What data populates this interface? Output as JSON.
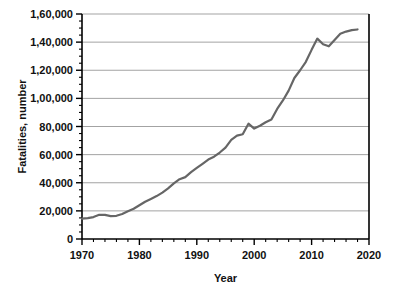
{
  "chart_data": {
    "type": "line",
    "title": "",
    "xlabel": "Year",
    "ylabel": "Fatalities, number",
    "xlim": [
      1970,
      2020
    ],
    "ylim": [
      0,
      160000
    ],
    "grid": "horizontal",
    "legend": "none",
    "line_color": "#666666",
    "axis_color": "#000000",
    "grid_color": "#999999",
    "x_ticks_major": [
      1970,
      1980,
      1990,
      2000,
      2010,
      2020
    ],
    "x_tick_labels": [
      "1970",
      "1980",
      "1990",
      "2000",
      "2010",
      "2020"
    ],
    "x_tick_minor_step": 2,
    "y_ticks_major": [
      0,
      20000,
      40000,
      60000,
      80000,
      100000,
      120000,
      140000,
      160000
    ],
    "y_tick_labels": [
      "0",
      "20,000",
      "40,000",
      "60,000",
      "80,000",
      "1,00,000",
      "1,20,000",
      "1,40,000",
      "1,60,000"
    ],
    "y_tick_minor_step": 5000,
    "series": [
      {
        "name": "Fatalities",
        "x": [
          1970,
          1971,
          1972,
          1973,
          1974,
          1975,
          1976,
          1977,
          1978,
          1979,
          1980,
          1981,
          1982,
          1983,
          1984,
          1985,
          1986,
          1987,
          1988,
          1989,
          1990,
          1991,
          1992,
          1993,
          1994,
          1995,
          1996,
          1997,
          1998,
          1999,
          2000,
          2001,
          2002,
          2003,
          2004,
          2005,
          2006,
          2007,
          2008,
          2009,
          2010,
          2011,
          2012,
          2013,
          2014,
          2015,
          2016,
          2017,
          2018
        ],
        "y": [
          14500,
          14800,
          15600,
          17200,
          17100,
          16300,
          16500,
          17800,
          19800,
          21500,
          24000,
          26500,
          28500,
          30500,
          33000,
          36000,
          39500,
          42500,
          44000,
          47500,
          50500,
          53500,
          56500,
          58500,
          61500,
          65000,
          70500,
          73500,
          74500,
          82000,
          78500,
          80500,
          83000,
          85000,
          92500,
          98500,
          105500,
          114500,
          120000,
          126000,
          134500,
          142500,
          138500,
          137000,
          141500,
          146000,
          147500,
          148500,
          149000
        ]
      }
    ],
    "annotations": []
  },
  "axes": {
    "y_axis_title": "Fatalities, number",
    "x_axis_title": "Year"
  }
}
